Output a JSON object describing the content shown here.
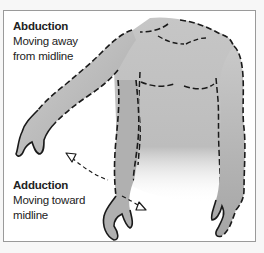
{
  "diagram": {
    "abduction": {
      "title": "Abduction",
      "description": "Moving away from midline"
    },
    "adduction": {
      "title": "Adduction",
      "description": "Moving toward midline"
    },
    "illustration": {
      "subject": "human torso with arms",
      "left_arm": "raised outward (abduction)",
      "right_arm": "hanging at side (adduction)",
      "arrow": "curved dashed double-headed arrow between arm positions"
    },
    "colors": {
      "background": "#f7f7f7",
      "panel": "#ffffff",
      "border": "#9a9a9a",
      "skin_shade": "#b8b8b8",
      "outline": "#1a1a1a",
      "text": "#222222"
    }
  }
}
